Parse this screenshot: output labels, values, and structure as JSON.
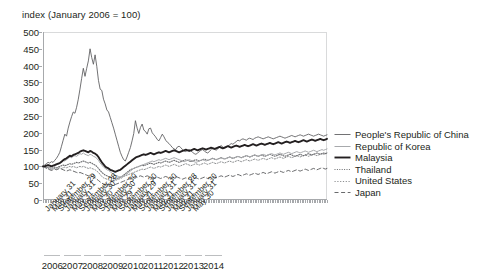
{
  "chart_data": {
    "type": "line",
    "title": "index (January 2006 = 100)",
    "xlabel": "",
    "ylabel": "index (January 2006 = 100)",
    "ylim": [
      0,
      500
    ],
    "ytick_step": 50,
    "yticks": [
      0,
      50,
      100,
      150,
      200,
      250,
      300,
      350,
      400,
      450,
      500
    ],
    "grid": false,
    "legend_position": "right",
    "x_start": "January 2006",
    "x_end": "May 2014",
    "x_frequency": "monthly",
    "xticks": [
      "January 31",
      "May 31",
      "September 29",
      "January 31",
      "May 31",
      "September 28",
      "January 30",
      "May 30",
      "September 30",
      "January 30",
      "May 29",
      "September 30",
      "January 29",
      "May 31",
      "September 30",
      "January 31",
      "May 31",
      "September 28",
      "January 31",
      "May 31",
      "September 30",
      "January 31",
      "May 30"
    ],
    "years": [
      "2006",
      "2007",
      "2008",
      "2009",
      "2010",
      "2011",
      "2012",
      "2013",
      "2014"
    ],
    "series": [
      {
        "name": "People's Republic of China",
        "style": "solid-thin",
        "color": "#58595b",
        "values": [
          100,
          104,
          108,
          112,
          110,
          114,
          112,
          118,
          124,
          132,
          142,
          160,
          178,
          196,
          190,
          214,
          232,
          248,
          262,
          258,
          276,
          300,
          330,
          362,
          392,
          368,
          392,
          414,
          450,
          424,
          404,
          432,
          398,
          356,
          330,
          326,
          300,
          286,
          268,
          262,
          246,
          230,
          214,
          196,
          178,
          160,
          142,
          130,
          120,
          116,
          128,
          142,
          156,
          176,
          198,
          236,
          214,
          198,
          216,
          226,
          208,
          204,
          196,
          212,
          214,
          200,
          194,
          188,
          180,
          176,
          186,
          196,
          188,
          178,
          172,
          168,
          162,
          156,
          152,
          150,
          158,
          160,
          156,
          150,
          146,
          144,
          148,
          150,
          146,
          142,
          138,
          136,
          140,
          144,
          148,
          150,
          146,
          142,
          140,
          144,
          150,
          156,
          152,
          148,
          152,
          158,
          162,
          158,
          154,
          156,
          160,
          164,
          168,
          166,
          170,
          174,
          178,
          176,
          180,
          182,
          180,
          178,
          182,
          184,
          182,
          180,
          184,
          186,
          188,
          186,
          184,
          182,
          184,
          186,
          188,
          186,
          184,
          182,
          184,
          186,
          188,
          190,
          188,
          186,
          184,
          186,
          188,
          190,
          192,
          190,
          188,
          190,
          192,
          194,
          192,
          190,
          192,
          194,
          196,
          194,
          192,
          190,
          192,
          194,
          196,
          194,
          192,
          190,
          192,
          194
        ]
      },
      {
        "name": "Republic of Korea",
        "style": "solid-light",
        "color": "#a7a9ac",
        "values": [
          100,
          98,
          100,
          104,
          102,
          100,
          102,
          106,
          108,
          106,
          110,
          114,
          118,
          116,
          120,
          124,
          128,
          126,
          130,
          132,
          130,
          134,
          138,
          136,
          140,
          136,
          134,
          132,
          136,
          134,
          130,
          128,
          124,
          118,
          110,
          104,
          98,
          94,
          90,
          88,
          84,
          80,
          76,
          74,
          72,
          70,
          68,
          70,
          72,
          74,
          78,
          82,
          86,
          90,
          94,
          96,
          98,
          100,
          102,
          104,
          106,
          108,
          110,
          112,
          114,
          116,
          114,
          116,
          118,
          120,
          118,
          120,
          122,
          124,
          122,
          120,
          122,
          124,
          126,
          124,
          122,
          120,
          118,
          116,
          114,
          116,
          118,
          120,
          118,
          116,
          114,
          112,
          114,
          116,
          118,
          120,
          118,
          116,
          118,
          120,
          122,
          124,
          122,
          120,
          122,
          124,
          126,
          124,
          122,
          124,
          126,
          128,
          126,
          124,
          126,
          128,
          130,
          128,
          126,
          128,
          130,
          132,
          130,
          128,
          130,
          132,
          134,
          132,
          130,
          132,
          134,
          136,
          134,
          132,
          134,
          136,
          138,
          136,
          134,
          136,
          138,
          140,
          138,
          136,
          138,
          140,
          142,
          140,
          138,
          140,
          142,
          144,
          142,
          140,
          142,
          144,
          146,
          144,
          142,
          144,
          146,
          148,
          146,
          144,
          146,
          148,
          150,
          148,
          150,
          152
        ]
      },
      {
        "name": "Malaysia",
        "style": "solid-bold",
        "color": "#231f20",
        "values": [
          100,
          100,
          102,
          104,
          102,
          100,
          102,
          104,
          106,
          108,
          110,
          114,
          118,
          122,
          124,
          128,
          132,
          130,
          134,
          136,
          138,
          140,
          144,
          146,
          148,
          146,
          144,
          142,
          146,
          144,
          140,
          138,
          134,
          128,
          120,
          112,
          106,
          100,
          96,
          94,
          90,
          88,
          86,
          84,
          86,
          88,
          90,
          94,
          98,
          102,
          106,
          110,
          114,
          118,
          122,
          126,
          128,
          130,
          132,
          134,
          136,
          134,
          136,
          138,
          140,
          138,
          136,
          138,
          140,
          142,
          140,
          142,
          144,
          146,
          144,
          142,
          144,
          146,
          148,
          146,
          144,
          142,
          144,
          146,
          148,
          150,
          148,
          146,
          148,
          150,
          152,
          150,
          148,
          150,
          152,
          154,
          152,
          150,
          152,
          154,
          156,
          154,
          152,
          154,
          156,
          158,
          156,
          154,
          156,
          158,
          160,
          158,
          156,
          158,
          160,
          162,
          160,
          158,
          160,
          162,
          164,
          162,
          160,
          162,
          164,
          166,
          164,
          162,
          164,
          166,
          168,
          166,
          164,
          166,
          168,
          170,
          168,
          166,
          168,
          170,
          172,
          170,
          168,
          170,
          172,
          174,
          172,
          170,
          172,
          174,
          176,
          174,
          172,
          174,
          176,
          178,
          176,
          174,
          176,
          178,
          180,
          178,
          176,
          178,
          180,
          182,
          180,
          178,
          180,
          182
        ]
      },
      {
        "name": "Thailand",
        "style": "dotted",
        "color": "#6d6e71",
        "values": [
          100,
          98,
          96,
          98,
          96,
          94,
          96,
          98,
          96,
          98,
          100,
          102,
          104,
          102,
          104,
          106,
          108,
          106,
          108,
          110,
          112,
          110,
          112,
          114,
          116,
          114,
          112,
          110,
          112,
          110,
          106,
          104,
          100,
          94,
          88,
          82,
          78,
          74,
          72,
          70,
          68,
          66,
          64,
          62,
          64,
          66,
          68,
          70,
          74,
          78,
          82,
          86,
          90,
          92,
          94,
          96,
          98,
          100,
          102,
          104,
          102,
          104,
          106,
          108,
          110,
          108,
          106,
          108,
          110,
          112,
          110,
          112,
          114,
          116,
          114,
          112,
          114,
          116,
          118,
          116,
          114,
          112,
          114,
          116,
          118,
          120,
          118,
          116,
          114,
          116,
          118,
          120,
          118,
          116,
          118,
          120,
          122,
          120,
          118,
          120,
          122,
          124,
          122,
          120,
          122,
          124,
          126,
          124,
          122,
          124,
          126,
          128,
          126,
          124,
          126,
          128,
          130,
          128,
          126,
          128,
          130,
          132,
          130,
          128,
          130,
          132,
          134,
          132,
          130,
          132,
          134,
          132,
          130,
          132,
          134,
          136,
          134,
          132,
          130,
          132,
          134,
          136,
          134,
          132,
          130,
          132,
          134,
          136,
          134,
          132,
          130,
          132,
          134,
          136,
          134,
          132,
          134,
          136,
          138,
          136,
          134,
          136,
          138,
          140,
          138,
          136,
          138,
          140,
          138,
          140
        ]
      },
      {
        "name": "United States",
        "style": "dashed-fine",
        "color": "#808285",
        "values": [
          100,
          98,
          96,
          94,
          92,
          90,
          92,
          94,
          92,
          94,
          96,
          94,
          96,
          98,
          96,
          98,
          100,
          98,
          100,
          98,
          96,
          98,
          100,
          98,
          100,
          98,
          96,
          94,
          96,
          94,
          92,
          90,
          86,
          82,
          76,
          70,
          66,
          64,
          62,
          60,
          58,
          56,
          56,
          58,
          60,
          62,
          64,
          66,
          70,
          72,
          74,
          76,
          78,
          80,
          82,
          84,
          86,
          88,
          90,
          92,
          90,
          92,
          94,
          96,
          98,
          96,
          94,
          96,
          98,
          100,
          98,
          100,
          102,
          104,
          102,
          100,
          102,
          104,
          106,
          104,
          102,
          100,
          102,
          104,
          106,
          108,
          106,
          104,
          102,
          104,
          106,
          108,
          106,
          104,
          106,
          108,
          110,
          108,
          106,
          108,
          110,
          112,
          110,
          108,
          110,
          112,
          114,
          112,
          110,
          112,
          114,
          116,
          114,
          112,
          114,
          116,
          118,
          116,
          114,
          116,
          118,
          120,
          118,
          116,
          118,
          120,
          122,
          120,
          118,
          120,
          122,
          124,
          122,
          120,
          122,
          124,
          126,
          124,
          122,
          124,
          126,
          128,
          126,
          124,
          126,
          128,
          130,
          128,
          126,
          128,
          130,
          132,
          130,
          128,
          130,
          132,
          134,
          132,
          130,
          132,
          134,
          136,
          134,
          132,
          134,
          136,
          138,
          136,
          138,
          140
        ]
      },
      {
        "name": "Japan",
        "style": "dashed-long",
        "color": "#58595b",
        "values": [
          100,
          98,
          94,
          92,
          90,
          88,
          90,
          92,
          90,
          92,
          94,
          92,
          90,
          88,
          86,
          88,
          90,
          88,
          86,
          84,
          82,
          80,
          82,
          80,
          78,
          76,
          74,
          72,
          74,
          72,
          68,
          66,
          62,
          58,
          54,
          50,
          48,
          46,
          46,
          48,
          46,
          44,
          44,
          46,
          48,
          50,
          52,
          54,
          56,
          58,
          60,
          62,
          64,
          66,
          68,
          70,
          68,
          70,
          72,
          70,
          68,
          70,
          72,
          70,
          68,
          66,
          64,
          66,
          68,
          66,
          64,
          66,
          68,
          70,
          68,
          66,
          64,
          66,
          68,
          70,
          68,
          66,
          64,
          62,
          64,
          66,
          64,
          62,
          60,
          62,
          64,
          66,
          64,
          62,
          64,
          66,
          68,
          66,
          64,
          66,
          68,
          70,
          68,
          66,
          68,
          70,
          72,
          70,
          68,
          70,
          72,
          74,
          72,
          70,
          72,
          74,
          76,
          74,
          72,
          74,
          76,
          78,
          76,
          74,
          76,
          78,
          80,
          78,
          76,
          78,
          80,
          82,
          80,
          78,
          80,
          82,
          84,
          82,
          80,
          82,
          84,
          86,
          84,
          82,
          84,
          86,
          88,
          86,
          84,
          86,
          88,
          90,
          88,
          86,
          88,
          90,
          92,
          90,
          88,
          90,
          92,
          94,
          92,
          90,
          92,
          94,
          96,
          94,
          92,
          94
        ]
      }
    ]
  }
}
